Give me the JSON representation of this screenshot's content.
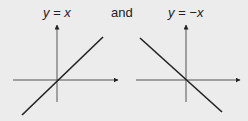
{
  "diagram": {
    "left_graph": {
      "label": "y = x",
      "line": {
        "x1": 22,
        "y1": 115,
        "x2": 103,
        "y2": 37
      },
      "axes": {
        "origin_x": 57,
        "origin_y": 80,
        "x_start": 13,
        "x_end": 118,
        "y_top": 25,
        "y_bottom": 102
      }
    },
    "connector": "and",
    "right_graph": {
      "label": "y = −x",
      "line": {
        "x1": 140,
        "y1": 38,
        "x2": 222,
        "y2": 112
      },
      "axes": {
        "origin_x": 186,
        "origin_y": 80,
        "x_start": 136,
        "x_end": 240,
        "y_top": 25,
        "y_bottom": 102
      }
    },
    "colors": {
      "background": "#ececec",
      "line": "#222222",
      "axis": "#444444"
    }
  }
}
